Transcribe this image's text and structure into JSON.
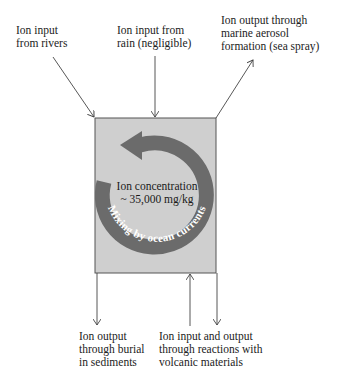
{
  "labels": {
    "rivers": [
      "Ion input",
      "from rivers"
    ],
    "rain": [
      "Ion input from",
      "rain (negligible)"
    ],
    "aerosol": [
      "Ion output through",
      "marine aerosol",
      "formation (sea spray)"
    ],
    "sediments": [
      "Ion output",
      "through burial",
      "in sediments"
    ],
    "volcanic": [
      "Ion input and output",
      "through reactions with",
      "volcanic materials"
    ]
  },
  "ocean": {
    "concentration_label": "Ion concentration",
    "concentration_value": "~ 35,000 mg/kg",
    "mixing_label": "Mixing by ocean currents"
  },
  "colors": {
    "box_fill": "#cfcfcf",
    "box_stroke": "#555555",
    "arrow": "#444444",
    "ring": "#6b6b6b",
    "ring_text": "#ffffff"
  }
}
